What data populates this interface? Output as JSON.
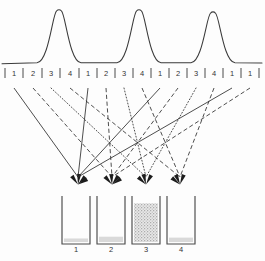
{
  "figure": {
    "description": "Three chromatographic peaks above a repeating 1-2-3-4 fraction tick axis; routing lines direct each numbered fraction into one of four collection beakers."
  },
  "chart_data": {
    "type": "line",
    "title": "",
    "xlabel": "",
    "ylabel": "",
    "grid": false,
    "legend": null,
    "xlim": [
      0,
      265
    ],
    "ylim": [
      0,
      1
    ],
    "series": [
      {
        "name": "detector-trace",
        "peak_count": 3,
        "peak_centers": [
          59,
          139,
          213
        ],
        "peak_label_positions": [
          "3",
          "3",
          "3"
        ],
        "peak_heights": [
          1.0,
          1.0,
          0.96
        ],
        "peak_width": 11,
        "baseline": 0.06
      }
    ],
    "tick_axis": {
      "label": "fraction number",
      "tick_labels": [
        "1",
        "2",
        "3",
        "4",
        "1",
        "2",
        "3",
        "4",
        "1",
        "2",
        "3",
        "4",
        "1",
        "1"
      ],
      "tick_positions": [
        14,
        33,
        51,
        70,
        88,
        106,
        124,
        142,
        160,
        178,
        196,
        214,
        232,
        250
      ],
      "separator_positions": [
        5,
        23,
        42,
        60,
        79,
        97,
        115,
        133,
        151,
        169,
        187,
        205,
        223,
        241,
        259
      ]
    }
  },
  "routing": {
    "label": "fraction routing lines",
    "line_styles": [
      "solid",
      "dashed",
      "dotted"
    ],
    "style_legend": {
      "solid": "fraction 1",
      "dashed": "fraction 2",
      "dotted": "fraction 3"
    },
    "target_count": 4,
    "target_positions": [
      78,
      112,
      146,
      180
    ],
    "target_y": 186,
    "source_y": 88,
    "routes": [
      {
        "source": 14,
        "target": 78,
        "style": "solid"
      },
      {
        "source": 33,
        "target": 112,
        "style": "dashed"
      },
      {
        "source": 51,
        "target": 146,
        "style": "dotted"
      },
      {
        "source": 70,
        "target": 180,
        "style": "dashed"
      },
      {
        "source": 88,
        "target": 78,
        "style": "solid"
      },
      {
        "source": 106,
        "target": 112,
        "style": "dashed"
      },
      {
        "source": 124,
        "target": 146,
        "style": "dotted"
      },
      {
        "source": 142,
        "target": 180,
        "style": "dashed"
      },
      {
        "source": 160,
        "target": 78,
        "style": "solid"
      },
      {
        "source": 178,
        "target": 112,
        "style": "dashed"
      },
      {
        "source": 196,
        "target": 146,
        "style": "dotted"
      },
      {
        "source": 214,
        "target": 180,
        "style": "dashed"
      },
      {
        "source": 232,
        "target": 78,
        "style": "solid"
      },
      {
        "source": 250,
        "target": 112,
        "style": "dashed"
      }
    ]
  },
  "beakers": {
    "label": "collection beakers",
    "count": 4,
    "items": [
      {
        "label": "1",
        "x": 62,
        "fill_level": 0.08,
        "fill_style": "light"
      },
      {
        "label": "2",
        "x": 97,
        "fill_level": 0.12,
        "fill_style": "light"
      },
      {
        "label": "3",
        "x": 132,
        "fill_level": 0.88,
        "fill_style": "heavy"
      },
      {
        "label": "4",
        "x": 167,
        "fill_level": 0.1,
        "fill_style": "light"
      }
    ],
    "geometry": {
      "width": 28,
      "height": 48,
      "top_y": 196,
      "label_y": 250
    }
  }
}
